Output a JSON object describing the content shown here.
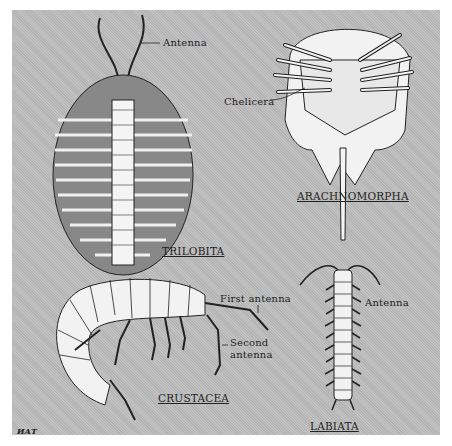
{
  "figure": {
    "background": "#bdbdbd",
    "groups": [
      {
        "id": "trilobita",
        "title": "TRILOBITA",
        "labels": [
          "Antenna"
        ]
      },
      {
        "id": "arachnomorpha",
        "title": "ARACHNOMORPHA",
        "labels": [
          "Chelicera"
        ]
      },
      {
        "id": "crustacea",
        "title": "CRUSTACEA",
        "labels": [
          "First antenna",
          "Second antenna"
        ]
      },
      {
        "id": "labiata",
        "title": "LABIATA",
        "labels": [
          "Antenna"
        ]
      }
    ],
    "signature": "ИАТ"
  },
  "labels": {
    "trilobita_antenna": "Antenna",
    "trilobita_title": "TRILOBITA",
    "chelicera": "Chelicera",
    "arachnomorpha_title": "ARACHNOMORPHA",
    "first_antenna": "First antenna",
    "second_antenna_1": "Second",
    "second_antenna_2": "antenna",
    "crustacea_title": "CRUSTACEA",
    "labiata_antenna": "Antenna",
    "labiata_title": "LABIATA",
    "signature": "ИАТ"
  }
}
